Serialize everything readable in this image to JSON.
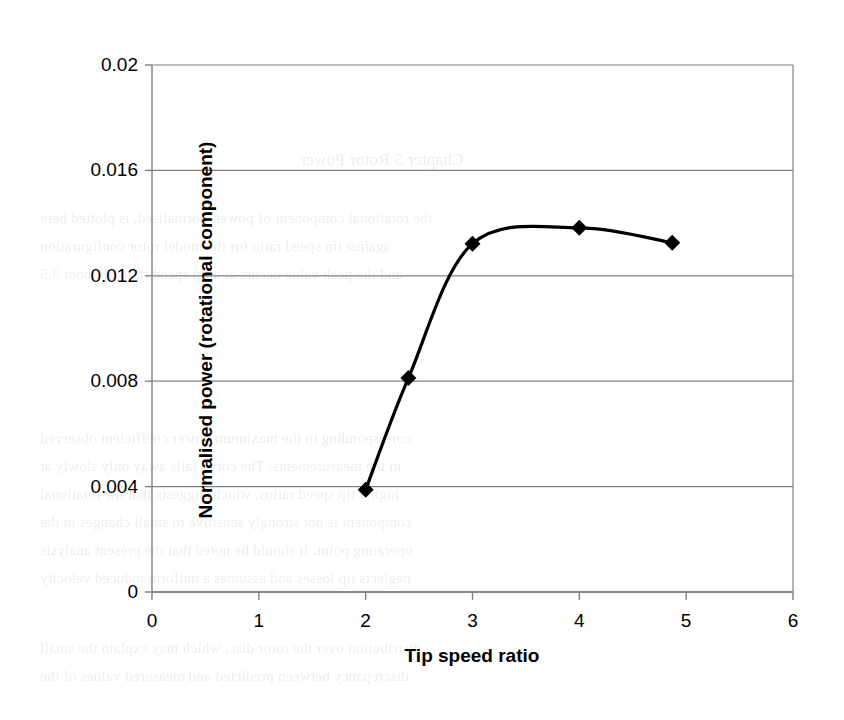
{
  "chart_data": {
    "type": "line",
    "title": "",
    "xlabel": "Tip speed ratio",
    "ylabel": "Normalised power (rotational component)",
    "xlim": [
      0,
      6
    ],
    "ylim": [
      0,
      0.02
    ],
    "xticks": [
      "0",
      "1",
      "2",
      "3",
      "4",
      "5",
      "6"
    ],
    "xtick_values": [
      0,
      1,
      2,
      3,
      4,
      5,
      6
    ],
    "yticks": [
      "0",
      "0.004",
      "0.008",
      "0.012",
      "0.016",
      "0.02"
    ],
    "ytick_values": [
      0,
      0.004,
      0.008,
      0.012,
      0.016,
      0.02
    ],
    "grid": "horizontal",
    "legend": "none",
    "marker": "diamond",
    "line_color": "#000000",
    "marker_color": "#000000",
    "gridline_color": "#808080",
    "axis_color": "#808080",
    "background": "#ffffff",
    "series": [
      {
        "name": "Normalised rotational power",
        "x": [
          2.0,
          2.4,
          3.0,
          4.0,
          4.87
        ],
        "values": [
          0.00388,
          0.00812,
          0.01322,
          0.01382,
          0.01325
        ]
      }
    ]
  },
  "ghost_text": {
    "lines": [
      "Chapter 5  Rotor Power",
      "the rotational component of power, normalised, is plotted here",
      "against tip speed ratio for the model rotor configuration",
      "and the peak value occurs at a tip speed ratio of about 3.5",
      "corresponding to the maximum power coefficient observed",
      "in the measurements. The curve falls away only slowly at",
      "higher tip speed ratios, which suggests that the rotational",
      "component is not strongly sensitive to small changes in the",
      "operating point. It should be noted that the present analysis",
      "neglects tip losses and assumes a uniform induced velocity",
      "distribution over the rotor disc, which may explain the small",
      "discrepancy between predicted and measured values of the"
    ]
  }
}
